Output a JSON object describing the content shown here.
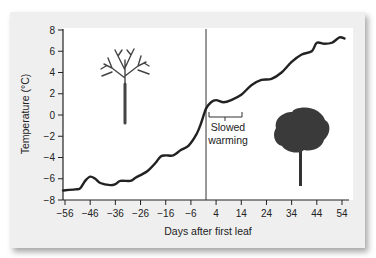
{
  "chart_data": {
    "type": "line",
    "title": "",
    "xlabel": "Days after first leaf",
    "ylabel": "Temperature (°C)",
    "xlim": [
      -56,
      56
    ],
    "ylim": [
      -8,
      8
    ],
    "x_ticks": [
      -56,
      -46,
      -36,
      -26,
      -16,
      -6,
      4,
      14,
      24,
      34,
      44,
      54
    ],
    "x_tick_labels": [
      "−56",
      "−46",
      "−36",
      "−26",
      "−16",
      "−6",
      "4",
      "14",
      "24",
      "34",
      "44",
      "54"
    ],
    "y_ticks": [
      8,
      6,
      4,
      2,
      0,
      -2,
      -4,
      -6,
      -8
    ],
    "y_tick_labels": [
      "8",
      "6",
      "4",
      "2",
      "0",
      "−2",
      "−4",
      "−6",
      "−8"
    ],
    "grid": false,
    "legend": null,
    "series": [
      {
        "name": "Temperature",
        "color": "#222222",
        "x": [
          -56,
          -52,
          -50,
          -48,
          -46,
          -44,
          -42,
          -38,
          -36,
          -34,
          -30,
          -28,
          -24,
          -22,
          -20,
          -18,
          -16,
          -13,
          -10,
          -7,
          -4,
          -2,
          0,
          2,
          4,
          7,
          10,
          14,
          18,
          22,
          26,
          30,
          34,
          38,
          42,
          44,
          47,
          50,
          53,
          55
        ],
        "y": [
          -7.1,
          -7.0,
          -6.9,
          -6.2,
          -5.8,
          -6.0,
          -6.4,
          -6.6,
          -6.5,
          -6.2,
          -6.2,
          -5.9,
          -5.4,
          -5.0,
          -4.5,
          -3.9,
          -3.8,
          -3.8,
          -3.3,
          -2.9,
          -1.9,
          -0.8,
          0.6,
          1.2,
          1.4,
          1.2,
          1.4,
          1.9,
          2.8,
          3.3,
          3.4,
          4.0,
          5.0,
          5.7,
          6.0,
          6.8,
          6.7,
          6.8,
          7.3,
          7.2
        ]
      }
    ],
    "reference_line": {
      "orientation": "vertical",
      "x": 0,
      "label": ""
    },
    "annotations": [
      {
        "text_line1": "Slowed",
        "text_line2": "warming",
        "bracket_x": [
          1,
          14
        ],
        "bracket_y": 0
      },
      {
        "text": "",
        "icon": "bare-tree",
        "position": "upper-left"
      },
      {
        "text": "",
        "icon": "leafy-tree",
        "position": "lower-right"
      }
    ]
  },
  "annotation": {
    "line1": "Slowed",
    "line2": "warming"
  },
  "axes": {
    "xlabel": "Days after first leaf",
    "ylabel": "Temperature (°C)"
  }
}
